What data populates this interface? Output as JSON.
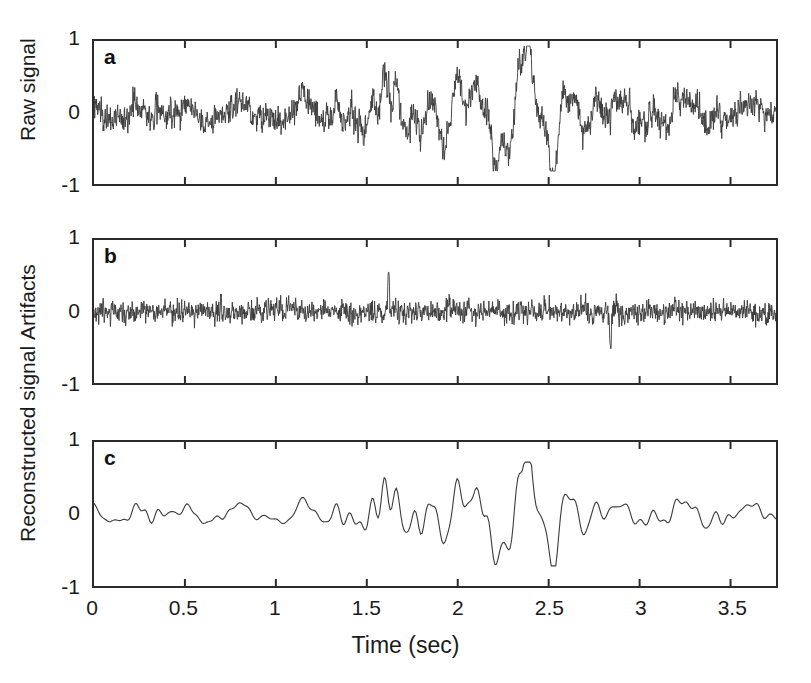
{
  "figure": {
    "background_color": "#ffffff",
    "line_color": "#3a3a3a",
    "axis_color": "#2b2b2b",
    "xlabel": "Time (sec)"
  },
  "chart_data": {
    "type": "line",
    "title": "",
    "subtitle": "",
    "xlabel": "Time (sec)",
    "grid": false,
    "legend": "none",
    "shared_x": true,
    "xlim": [
      0,
      3.75
    ],
    "xticks": [
      0,
      0.5,
      1,
      1.5,
      2,
      2.5,
      3,
      3.5
    ],
    "xtick_labels": [
      "0",
      "0.5",
      "1",
      "1.5",
      "2",
      "2.5",
      "3",
      "3.5"
    ],
    "ylim": [
      -1,
      1
    ],
    "yticks": [
      1,
      0,
      -1
    ],
    "ytick_labels": [
      "1",
      "0",
      "-1"
    ],
    "panels": [
      {
        "letter": "a",
        "ylabel": "Raw signal",
        "description": "Broadband noisy EEG-like raw recording with high-frequency artifact noise superimposed on slower large-amplitude oscillations; amplitude grows between 1.4 and 2.7 sec.",
        "noise_amplitude": 0.19,
        "baseline_amplitude": 0.1,
        "peak_min": -0.82,
        "peak_max": 0.93,
        "burst_window": [
          1.4,
          2.7
        ],
        "series": [
          {
            "name": "raw",
            "sampling_hz": 500,
            "n_samples": 1875
          }
        ],
        "envelope_x": [
          0,
          0.25,
          0.5,
          0.75,
          1.0,
          1.25,
          1.4,
          1.5,
          1.6,
          1.75,
          1.9,
          2.05,
          2.2,
          2.35,
          2.5,
          2.65,
          2.8,
          3.0,
          3.25,
          3.5,
          3.75
        ],
        "envelope_y": [
          0.13,
          0.16,
          0.13,
          0.13,
          0.14,
          0.16,
          0.24,
          0.42,
          0.5,
          0.38,
          0.34,
          0.38,
          0.46,
          0.52,
          0.58,
          0.38,
          0.26,
          0.2,
          0.17,
          0.16,
          0.15
        ]
      },
      {
        "letter": "b",
        "ylabel": "Artifacts",
        "description": "Extracted high-frequency artifact component; dense narrow band of noise centred on zero with isolated spikes near 1.62 and 2.84 sec.",
        "noise_amplitude": 0.13,
        "baseline_amplitude": 0.12,
        "peak_min": -0.58,
        "peak_max": 0.55,
        "burst_window": [
          0,
          3.75
        ],
        "series": [
          {
            "name": "artifacts",
            "sampling_hz": 500,
            "n_samples": 1875
          }
        ],
        "envelope_x": [
          0,
          0.5,
          1.0,
          1.5,
          1.62,
          2.0,
          2.5,
          2.84,
          3.0,
          3.5,
          3.75
        ],
        "envelope_y": [
          0.12,
          0.12,
          0.12,
          0.12,
          0.14,
          0.12,
          0.12,
          0.14,
          0.12,
          0.12,
          0.12
        ],
        "spikes": [
          {
            "t": 1.62,
            "value": 0.55
          },
          {
            "t": 2.84,
            "value": -0.58
          }
        ]
      },
      {
        "letter": "c",
        "ylabel": "Reconstructed signal",
        "description": "Artifact-free reconstruction: smooth low-frequency waveform preserving the raw envelope without the high-frequency noise.",
        "noise_amplitude": 0.0,
        "baseline_amplitude": 0.09,
        "peak_min": -0.72,
        "peak_max": 0.72,
        "burst_window": [
          1.4,
          2.7
        ],
        "series": [
          {
            "name": "reconstructed",
            "sampling_hz": 120,
            "n_samples": 450
          }
        ],
        "envelope_x": [
          0,
          0.25,
          0.5,
          0.75,
          1.0,
          1.25,
          1.4,
          1.5,
          1.6,
          1.75,
          1.9,
          2.05,
          2.2,
          2.35,
          2.5,
          2.65,
          2.8,
          3.0,
          3.25,
          3.5,
          3.75
        ],
        "envelope_y": [
          0.12,
          0.15,
          0.11,
          0.11,
          0.12,
          0.14,
          0.22,
          0.38,
          0.46,
          0.34,
          0.3,
          0.34,
          0.42,
          0.48,
          0.52,
          0.34,
          0.22,
          0.17,
          0.15,
          0.14,
          0.13
        ]
      }
    ]
  },
  "layout": {
    "plot_left": 92,
    "plot_right": 778,
    "panel_a_top": 39,
    "panel_a_bottom": 186,
    "panel_b_top": 238,
    "panel_b_bottom": 385,
    "panel_c_top": 440,
    "panel_c_bottom": 588,
    "xlabel_y": 632
  }
}
